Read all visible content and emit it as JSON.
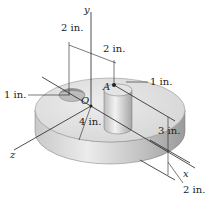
{
  "figure": {
    "axes": {
      "x": "x",
      "y": "y",
      "z": "z"
    },
    "points": {
      "origin": "O",
      "point_a": "A"
    },
    "dimensions": {
      "top_left_offset": "2 in.",
      "top_right_offset": "2 in.",
      "hole_radius": "1 in.",
      "cylinder_radius": "1 in.",
      "disk_radius": "4 in.",
      "cylinder_height": "3 in.",
      "disk_thickness": "2 in."
    },
    "colors": {
      "surface_light": "#e6e6e6",
      "surface_mid": "#cfcfcf",
      "surface_dark": "#a9a9a9",
      "line": "#222222"
    }
  }
}
